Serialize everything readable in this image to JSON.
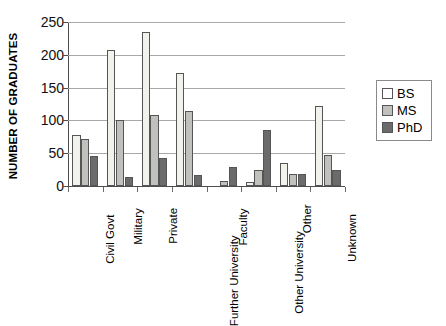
{
  "chart_data": {
    "type": "bar",
    "title": "",
    "xlabel": "",
    "ylabel": "NUMBER OF GRADUATES",
    "ylim": [
      0,
      250
    ],
    "yticks": [
      0,
      50,
      100,
      150,
      200,
      250
    ],
    "grid": true,
    "legend_position": "right",
    "categories": [
      "Civil Govt",
      "Military",
      "Private",
      "Further University",
      "Faculty",
      "Other University",
      "Other",
      "Unknown"
    ],
    "series": [
      {
        "name": "BS",
        "color": "#f2f1ec",
        "values": [
          78,
          208,
          235,
          173,
          0,
          6,
          35,
          122
        ]
      },
      {
        "name": "MS",
        "color": "#c0c0bd",
        "values": [
          71,
          101,
          109,
          115,
          8,
          24,
          18,
          48
        ]
      },
      {
        "name": "PhD",
        "color": "#6b6b6b",
        "values": [
          46,
          13,
          42,
          17,
          29,
          85,
          18,
          24
        ]
      }
    ]
  },
  "legend": {
    "items": [
      {
        "label": "BS"
      },
      {
        "label": "MS"
      },
      {
        "label": "PhD"
      }
    ]
  },
  "axis": {
    "y_title": "NUMBER OF GRADUATES",
    "y_tick_labels": [
      "250",
      "200",
      "150",
      "100",
      "50",
      "0"
    ]
  },
  "colors": {
    "bs": "#f2f1ec",
    "ms": "#c0c0bd",
    "phd": "#6b6b6b",
    "axis": "#4d4d4d",
    "gridline": "#a8a8a8",
    "text": "#000000",
    "background": "#ffffff"
  }
}
